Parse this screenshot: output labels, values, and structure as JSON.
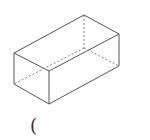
{
  "diagram": {
    "type": "cuboid",
    "caption_text": "(",
    "colors": {
      "edge": "#555555",
      "hidden_edge": "#777777",
      "background": "#ffffff"
    },
    "vertices": {
      "top_back": [
        84,
        15
      ],
      "top_left": [
        14,
        53
      ],
      "top_front": [
        49,
        71
      ],
      "top_right": [
        119,
        34
      ],
      "bottom_left": [
        14,
        84
      ],
      "bottom_front": [
        49,
        104
      ],
      "bottom_right": [
        119,
        66
      ],
      "bottom_back": [
        84,
        48
      ]
    }
  }
}
